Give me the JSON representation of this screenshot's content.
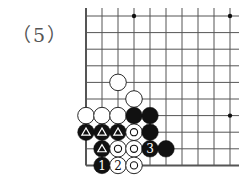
{
  "problem_label": "（5）",
  "board": {
    "origin_x": 86,
    "origin_y": 16,
    "spacing_x": 16,
    "spacing_y": 16.6,
    "cols": 10,
    "rows": 10,
    "edges": [
      "left",
      "bottom"
    ],
    "star_points": [
      [
        3,
        0
      ],
      [
        9,
        0
      ],
      [
        9,
        6
      ]
    ],
    "line_color": "#555555",
    "stone_black": "#111111",
    "stone_white": "#ffffff"
  },
  "stones": [
    {
      "col": 2,
      "row": 4,
      "color": "white",
      "mark": ""
    },
    {
      "col": 3,
      "row": 5,
      "color": "white",
      "mark": ""
    },
    {
      "col": 0,
      "row": 6,
      "color": "white",
      "mark": ""
    },
    {
      "col": 1,
      "row": 6,
      "color": "white",
      "mark": ""
    },
    {
      "col": 2,
      "row": 6,
      "color": "white",
      "mark": ""
    },
    {
      "col": 3,
      "row": 6,
      "color": "black",
      "mark": ""
    },
    {
      "col": 4,
      "row": 6,
      "color": "black",
      "mark": ""
    },
    {
      "col": 0,
      "row": 7,
      "color": "black",
      "mark": "triangle"
    },
    {
      "col": 1,
      "row": 7,
      "color": "black",
      "mark": "triangle"
    },
    {
      "col": 2,
      "row": 7,
      "color": "black",
      "mark": "triangle"
    },
    {
      "col": 3,
      "row": 7,
      "color": "white",
      "mark": "circle"
    },
    {
      "col": 4,
      "row": 7,
      "color": "black",
      "mark": ""
    },
    {
      "col": 1,
      "row": 8,
      "color": "black",
      "mark": "triangle"
    },
    {
      "col": 2,
      "row": 8,
      "color": "white",
      "mark": "circle"
    },
    {
      "col": 3,
      "row": 8,
      "color": "white",
      "mark": "circle"
    },
    {
      "col": 4,
      "row": 8,
      "color": "black",
      "mark": "3"
    },
    {
      "col": 5,
      "row": 8,
      "color": "black",
      "mark": ""
    },
    {
      "col": 1,
      "row": 9,
      "color": "black",
      "mark": "1"
    },
    {
      "col": 2,
      "row": 9,
      "color": "white",
      "mark": "2"
    },
    {
      "col": 3,
      "row": 9,
      "color": "white",
      "mark": "circle"
    }
  ]
}
